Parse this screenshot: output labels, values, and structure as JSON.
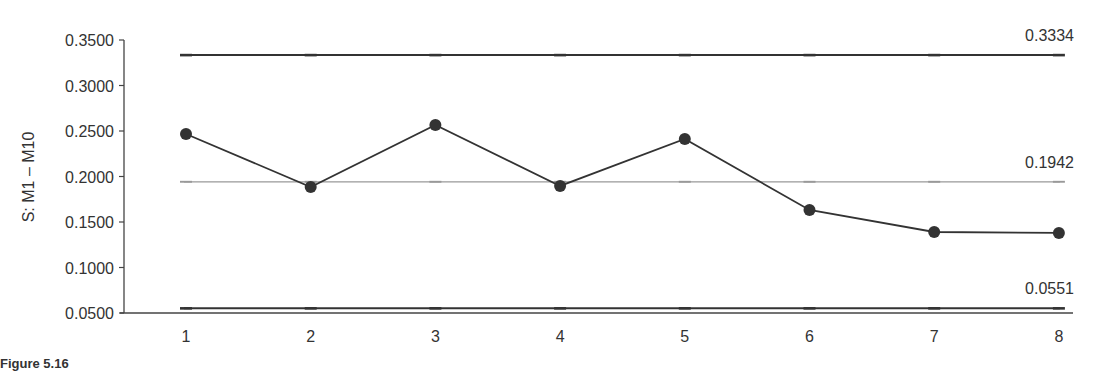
{
  "caption": "Figure 5.16",
  "chart_data": {
    "type": "line",
    "title": "",
    "xlabel": "",
    "ylabel": "S: M1 – M10",
    "x": [
      1,
      2,
      3,
      4,
      5,
      6,
      7,
      8
    ],
    "categories": [
      "1",
      "2",
      "3",
      "4",
      "5",
      "6",
      "7",
      "8"
    ],
    "series": [
      {
        "name": "S",
        "values": [
          0.2467,
          0.1885,
          0.2566,
          0.1896,
          0.2412,
          0.1632,
          0.139,
          0.138
        ]
      }
    ],
    "control_limits": {
      "ucl": {
        "value": 0.3334,
        "label": "0.3334"
      },
      "center": {
        "value": 0.1942,
        "label": "0.1942"
      },
      "lcl": {
        "value": 0.0551,
        "label": "0.0551"
      }
    },
    "ylim": [
      0.05,
      0.35
    ],
    "yticks": [
      0.35,
      0.3,
      0.25,
      0.2,
      0.15,
      0.1,
      0.05
    ],
    "ytick_labels": [
      "0.3500",
      "0.3000",
      "0.2500",
      "0.2000",
      "0.1500",
      "0.1000",
      "0.0500"
    ],
    "grid": false,
    "legend": "none",
    "colors": {
      "line": "#333333",
      "marker": "#333333",
      "limits": "#333333",
      "center": "#999999"
    }
  }
}
